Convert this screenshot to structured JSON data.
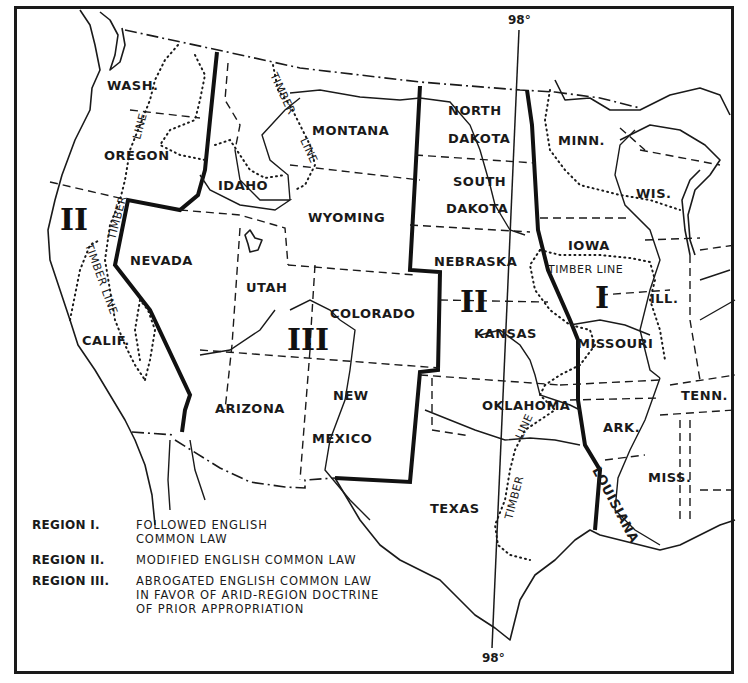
{
  "map": {
    "meridian": {
      "label_top": "98°",
      "label_bottom": "98°"
    },
    "region_numerals": {
      "region_2_west": "II",
      "region_3": "III",
      "region_2_east": "II",
      "region_1": "I"
    },
    "states": {
      "wash": "WASH.",
      "oregon": "OREGON",
      "calif": "CALIF.",
      "idaho": "IDAHO",
      "nevada": "NEVADA",
      "montana": "MONTANA",
      "wyoming": "WYOMING",
      "utah": "UTAH",
      "colorado": "COLORADO",
      "arizona": "ARIZONA",
      "new": "NEW",
      "mexico": "MEXICO",
      "north": "NORTH",
      "dakota_n": "DAKOTA",
      "south": "SOUTH",
      "dakota_s": "DAKOTA",
      "nebraska": "NEBRASKA",
      "kansas": "KANSAS",
      "oklahoma": "OKLAHOMA",
      "texas": "TEXAS",
      "minn": "MINN.",
      "wis": "WIS.",
      "iowa": "IOWA",
      "ill": "ILL.",
      "missouri": "MISSOURI",
      "ark": "ARK.",
      "tenn": "TENN.",
      "miss": "MISS.",
      "louisiana": "LOUISIANA"
    },
    "timber_line_labels": {
      "wa_line": "LINE",
      "or_timber": "TIMBER",
      "mt_timber": "TIMBER",
      "mt_line": "LINE",
      "ca_timber_line": "TIMBER LINE",
      "iowa_timber_line": "TIMBER LINE",
      "ok_line": "LINE",
      "tx_timber": "TIMBER"
    }
  },
  "legend": {
    "items": [
      {
        "key": "REGION I.",
        "lines": [
          "FOLLOWED ENGLISH",
          "COMMON LAW"
        ]
      },
      {
        "key": "REGION II.",
        "lines": [
          "MODIFIED ENGLISH COMMON LAW"
        ]
      },
      {
        "key": "REGION III.",
        "lines": [
          "ABROGATED ENGLISH COMMON LAW",
          "IN FAVOR OF ARID-REGION DOCTRINE",
          "OF PRIOR APPROPRIATION"
        ]
      }
    ]
  }
}
